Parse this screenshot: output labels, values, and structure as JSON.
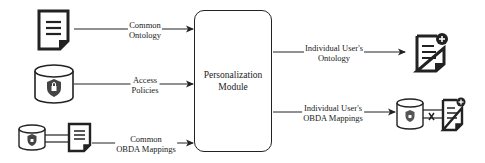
{
  "module": {
    "line1": "Personalization",
    "line2": "Module"
  },
  "inputs": [
    {
      "line1": "Common",
      "line2": "Ontology",
      "icon": "document-icon"
    },
    {
      "line1": "Access",
      "line2": "Policies",
      "icon": "database-lock-icon"
    },
    {
      "line1": "Common",
      "line2": "OBDA Mappings",
      "icon": "database-document-link-icon"
    }
  ],
  "outputs": [
    {
      "line1": "Individual User's",
      "line2": "Ontology",
      "icon": "document-plus-icon"
    },
    {
      "line1": "Individual User's",
      "line2": "OBDA Mappings",
      "icon": "database-document-plus-icon"
    }
  ],
  "colors": {
    "stroke": "#222222",
    "background": "#ffffff"
  }
}
